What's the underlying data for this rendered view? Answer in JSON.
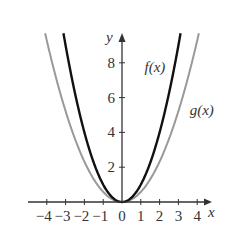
{
  "chart_data": {
    "type": "line",
    "title": "",
    "xlabel": "x",
    "ylabel": "y",
    "xlim": [
      -4.8,
      4.8
    ],
    "ylim": [
      0,
      9.7
    ],
    "grid": false,
    "x_ticks": [
      -4,
      -3,
      -2,
      -1,
      0,
      1,
      2,
      3,
      4
    ],
    "x_tick_labels": [
      "−4",
      "−3",
      "−2",
      "−1",
      "0",
      "1",
      "2",
      "3",
      "4"
    ],
    "y_ticks": [
      2,
      4,
      6,
      8
    ],
    "y_tick_labels": [
      "2",
      "4",
      "6",
      "8"
    ],
    "series": [
      {
        "name": "f(x)",
        "formula": "x^2",
        "color": "#111111",
        "coef": 1.0,
        "x": [
          -3,
          -2,
          -1,
          0,
          1,
          2,
          3
        ],
        "values": [
          9,
          4,
          1,
          0,
          1,
          4,
          9
        ]
      },
      {
        "name": "g(x)",
        "formula": "0.6x^2",
        "color": "#999999",
        "coef": 0.58,
        "x": [
          -4,
          -3,
          -2,
          -1,
          0,
          1,
          2,
          3,
          4
        ],
        "values": [
          9.3,
          5.2,
          2.3,
          0.58,
          0,
          0.58,
          2.3,
          5.2,
          9.3
        ]
      }
    ],
    "annotations": [
      {
        "text": "f(x)",
        "x": 1.2,
        "y": 7.5
      },
      {
        "text": "g(x)",
        "x": 3.6,
        "y": 5.0
      }
    ],
    "legend": "none (inline curve labels)"
  }
}
